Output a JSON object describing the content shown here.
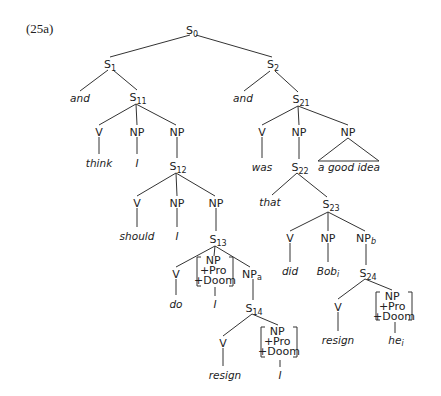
{
  "example_label": "(25a)",
  "colors": {
    "line": "#333333",
    "text": "#222222",
    "background": "#ffffff"
  },
  "nodes": {
    "s0": {
      "cat": "S",
      "sub": "0"
    },
    "s1": {
      "cat": "S",
      "sub": "1"
    },
    "s2": {
      "cat": "S",
      "sub": "2"
    },
    "and1": {
      "word": "and"
    },
    "s11": {
      "cat": "S",
      "sub": "11"
    },
    "and2": {
      "word": "and"
    },
    "s21": {
      "cat": "S",
      "sub": "21"
    },
    "v11": {
      "cat": "V"
    },
    "np11a": {
      "cat": "NP"
    },
    "np11b": {
      "cat": "NP"
    },
    "think": {
      "word": "think"
    },
    "i1": {
      "word": "I"
    },
    "s12": {
      "cat": "S",
      "sub": "12"
    },
    "v12": {
      "cat": "V"
    },
    "np12a": {
      "cat": "NP"
    },
    "np12b": {
      "cat": "NP"
    },
    "should": {
      "word": "should"
    },
    "i2": {
      "word": "I"
    },
    "s13": {
      "cat": "S",
      "sub": "13"
    },
    "v13": {
      "cat": "V"
    },
    "np13_feat": {
      "l1": "NP",
      "l2": "+Pro",
      "l3": "+Doom"
    },
    "np13a": {
      "cat": "NP",
      "sub": "a"
    },
    "do": {
      "word": "do"
    },
    "i3": {
      "word": "I"
    },
    "s14": {
      "cat": "S",
      "sub": "14"
    },
    "v14": {
      "cat": "V"
    },
    "np14_feat": {
      "l1": "NP",
      "l2": "+Pro",
      "l3": "+Doom"
    },
    "resign1": {
      "word": "resign"
    },
    "i4": {
      "word": "I"
    },
    "v21": {
      "cat": "V"
    },
    "np21a": {
      "cat": "NP"
    },
    "np21b": {
      "cat": "NP"
    },
    "was": {
      "word": "was"
    },
    "s22": {
      "cat": "S",
      "sub": "22"
    },
    "good_idea": {
      "word": "a good idea"
    },
    "that": {
      "word": "that"
    },
    "s23": {
      "cat": "S",
      "sub": "23"
    },
    "v23": {
      "cat": "V"
    },
    "np23a": {
      "cat": "NP"
    },
    "np23b": {
      "cat": "NP",
      "sub": "b"
    },
    "did": {
      "word": "did"
    },
    "bob": {
      "word": "Bob",
      "sub": "i"
    },
    "s24": {
      "cat": "S",
      "sub": "24"
    },
    "v24": {
      "cat": "V"
    },
    "np24_feat": {
      "l1": "NP",
      "l2": "+Pro",
      "l3": "+Doom"
    },
    "resign2": {
      "word": "resign"
    },
    "he": {
      "word": "he",
      "sub": "i"
    }
  }
}
